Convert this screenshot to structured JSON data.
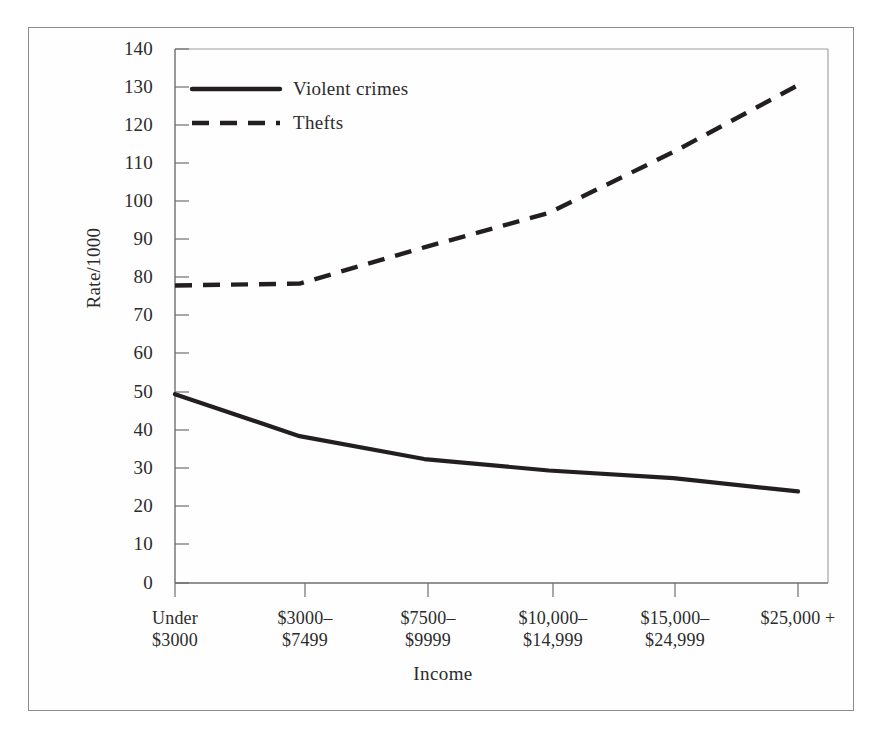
{
  "chart_data": {
    "type": "line",
    "title": "",
    "xlabel": "Income",
    "ylabel": "Rate/1000",
    "categories": [
      "Under\n$3000",
      "$3000–\n$7499",
      "$7500–\n$9999",
      "$10,000–\n$14,999",
      "$15,000–\n$24,999",
      "$25,000 +"
    ],
    "category_lines": [
      [
        "Under",
        "$3000"
      ],
      [
        "$3000–",
        "$7499"
      ],
      [
        "$7500–",
        "$9999"
      ],
      [
        "$10,000–",
        "$14,999"
      ],
      [
        "$15,000–",
        "$24,999"
      ],
      [
        "$25,000 +",
        ""
      ]
    ],
    "series": [
      {
        "name": "Violent crimes",
        "style": "solid",
        "color": "#231f20",
        "values": [
          49.5,
          38.5,
          32.5,
          29.5,
          27.5,
          24.0
        ]
      },
      {
        "name": "Thefts",
        "style": "dashed",
        "color": "#231f20",
        "values": [
          78.0,
          78.5,
          88.0,
          97.0,
          113.0,
          130.5
        ]
      }
    ],
    "ylim": [
      0,
      140
    ],
    "ytick_step": 10,
    "yticks": [
      0,
      10,
      20,
      30,
      40,
      50,
      60,
      70,
      80,
      90,
      100,
      110,
      120,
      130,
      140
    ],
    "grid": false,
    "legend_position": "top-left-inside"
  },
  "legend": {
    "entries": [
      {
        "label": "Violent crimes",
        "style": "solid"
      },
      {
        "label": "Thefts",
        "style": "dashed"
      }
    ]
  },
  "axes": {
    "ylabel": "Rate/1000",
    "xlabel": "Income",
    "ytick_labels": [
      "140",
      "130",
      "120",
      "110",
      "100",
      "90",
      "80",
      "70",
      "60",
      "50",
      "40",
      "30",
      "20",
      "10",
      "0"
    ],
    "xtick_labels": [
      {
        "line1": "Under",
        "line2": "$3000"
      },
      {
        "line1": "$3000–",
        "line2": "$7499"
      },
      {
        "line1": "$7500–",
        "line2": "$9999"
      },
      {
        "line1": "$10,000–",
        "line2": "$14,999"
      },
      {
        "line1": "$15,000–",
        "line2": "$24,999"
      },
      {
        "line1": "$25,000 +",
        "line2": ""
      }
    ]
  },
  "style": {
    "line_color": "#231f20",
    "axis_color": "#6e6e6e",
    "frame_color": "#8c8c8c",
    "background": "#ffffff",
    "text_color": "#2b2b2b"
  }
}
